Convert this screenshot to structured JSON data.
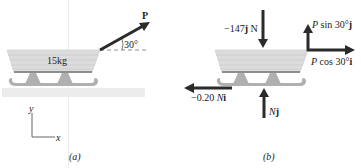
{
  "panel_a": {
    "caption": "(a)",
    "mass_label": "15kg",
    "force_label": "P",
    "angle_label": "30°",
    "axes": {
      "x": "x",
      "y": "y"
    }
  },
  "panel_b": {
    "caption": "(b)",
    "forces": {
      "weight": {
        "prefix": "−147",
        "unit_vec": "j",
        "suffix": " N"
      },
      "p_sin": {
        "var": "P",
        "text": " sin 30°",
        "unit_vec": "j"
      },
      "p_cos": {
        "var": "P",
        "text": " cos 30°",
        "unit_vec": "i"
      },
      "friction": {
        "prefix": "−0.20 ",
        "var": "N",
        "unit_vec": "i"
      },
      "normal": {
        "var": "N",
        "unit_vec": "j"
      }
    }
  },
  "colors": {
    "sled_body": "#d9d9d9",
    "sled_lines": "#c4c4c4",
    "runner": "#a8a8a8",
    "ground": "#ececec",
    "arrow": "#2b2b2b"
  }
}
